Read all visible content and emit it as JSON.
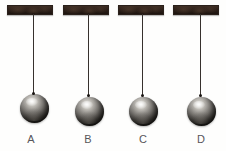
{
  "figure": {
    "background_color": "#fefefd",
    "width": 226,
    "height": 151
  },
  "palette": {
    "support_dark": "#241a14",
    "support_light": "#3d2d23",
    "string": "#3a3430",
    "ball_highlight": "#f2f1ee",
    "ball_shadow": "#141210",
    "label_text": "#58565a"
  },
  "pendulums": [
    {
      "id": "A",
      "label": "A",
      "support": {
        "left": 7,
        "top": 5,
        "width": 46,
        "height": 10
      },
      "string": {
        "x": 33,
        "top": 14,
        "length": 80
      },
      "ball": {
        "center_x": 34,
        "center_y": 108,
        "diameter": 29
      },
      "label_pos": {
        "center_x": 31,
        "top": 133
      }
    },
    {
      "id": "B",
      "label": "B",
      "support": {
        "left": 63,
        "top": 5,
        "width": 46,
        "height": 10
      },
      "string": {
        "x": 88,
        "top": 14,
        "length": 82
      },
      "ball": {
        "center_x": 89,
        "center_y": 111,
        "diameter": 29
      },
      "label_pos": {
        "center_x": 88,
        "top": 133
      }
    },
    {
      "id": "C",
      "label": "C",
      "support": {
        "left": 118,
        "top": 5,
        "width": 46,
        "height": 10
      },
      "string": {
        "x": 142,
        "top": 14,
        "length": 82
      },
      "ball": {
        "center_x": 143,
        "center_y": 111,
        "diameter": 29
      },
      "label_pos": {
        "center_x": 143,
        "top": 133
      }
    },
    {
      "id": "D",
      "label": "D",
      "support": {
        "left": 173,
        "top": 5,
        "width": 46,
        "height": 10
      },
      "string": {
        "x": 200,
        "top": 14,
        "length": 82
      },
      "ball": {
        "center_x": 201,
        "center_y": 111,
        "diameter": 29
      },
      "label_pos": {
        "center_x": 201,
        "top": 133
      }
    }
  ]
}
